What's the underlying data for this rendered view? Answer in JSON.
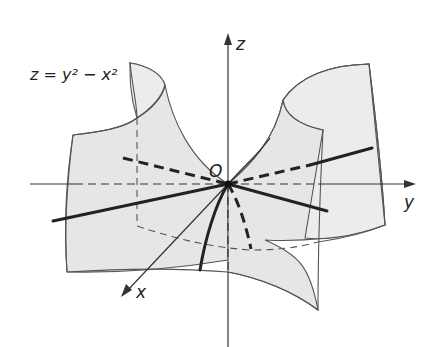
{
  "figure": {
    "equation_label": "z = y² − x²",
    "axes": {
      "x_label": "x",
      "y_label": "y",
      "z_label": "z",
      "origin_label": "O"
    },
    "surface": "hyperbolic paraboloid (saddle)",
    "colors": {
      "surface_fill": "#e6e6e6",
      "edge": "#555555",
      "curve": "#222222"
    }
  }
}
